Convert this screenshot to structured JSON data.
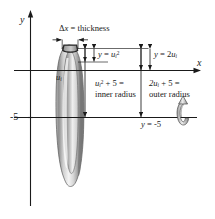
{
  "figure": {
    "background_color": "#ffffff",
    "line_color": "#1a1a1a",
    "solid_fill_light": "#f2f2f2",
    "solid_fill_mid": "#b8b8b8",
    "solid_fill_dark": "#7a7a7a"
  },
  "axes": {
    "y_label": "y",
    "x_label": "x",
    "y_tick_label": "-5"
  },
  "annotations": {
    "thickness": {
      "text": "Δx = thickness",
      "delta": "Δ",
      "var": "x",
      "equals": " = thickness"
    },
    "inner_curve": {
      "lhs": "y",
      "eq": " = ",
      "base": "u",
      "sub": "i",
      "sup": "2",
      "full": "y = u i 2"
    },
    "outer_curve": {
      "lhs": "y",
      "eq": " = 2",
      "base": "u",
      "sub": "i",
      "full": "y = 2u i"
    },
    "inner_radius": {
      "line1_base": "u",
      "line1_sub": "i",
      "line1_sup": "2",
      "line1_rest": " + 5 =",
      "line2": "inner radius"
    },
    "outer_radius": {
      "line1_base": "2u",
      "line1_sub": "i",
      "line1_rest": " + 5 =",
      "line2": "outer radius"
    },
    "axis_of_revolution": {
      "lhs": "y",
      "eq": " = ",
      "value": "-5"
    },
    "shell_radius_marker": {
      "base": "u",
      "sub": "i"
    }
  },
  "icons": {
    "rotation_arrow": "rotation-arrow-icon",
    "dimension_arrow": "dimension-arrow-icon"
  }
}
